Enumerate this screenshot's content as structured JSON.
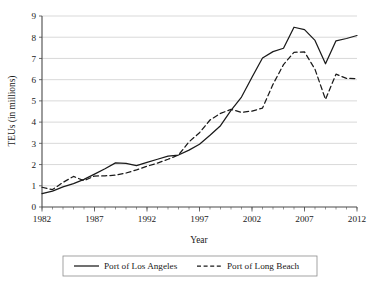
{
  "chart_data": {
    "type": "line",
    "title": "",
    "xlabel": "Year",
    "ylabel": "TEUs (in millions)",
    "xlim": [
      1982,
      2012
    ],
    "ylim": [
      0,
      9
    ],
    "grid": true,
    "legend_position": "bottom",
    "y_ticks": [
      "0",
      "1",
      "2",
      "3",
      "4",
      "5",
      "6",
      "7",
      "8",
      "9"
    ],
    "x_ticks": [
      "1982",
      "1987",
      "1992",
      "1997",
      "2002",
      "2007",
      "2012"
    ],
    "x": [
      1982,
      1983,
      1984,
      1985,
      1986,
      1987,
      1988,
      1989,
      1990,
      1991,
      1992,
      1993,
      1994,
      1995,
      1996,
      1997,
      1998,
      1999,
      2000,
      2001,
      2002,
      2003,
      2004,
      2005,
      2006,
      2007,
      2008,
      2009,
      2010,
      2011,
      2012
    ],
    "series": [
      {
        "name": "Port of Los Angeles",
        "style": "solid",
        "color": "#1a1a1a",
        "values": [
          0.63,
          0.75,
          0.95,
          1.1,
          1.3,
          1.55,
          1.8,
          2.08,
          2.06,
          1.95,
          2.1,
          2.25,
          2.4,
          2.45,
          2.68,
          2.96,
          3.38,
          3.83,
          4.55,
          5.18,
          6.11,
          7.02,
          7.32,
          7.48,
          8.47,
          8.36,
          7.85,
          6.75,
          7.83,
          7.94,
          8.08
        ]
      },
      {
        "name": "Port of Long Beach",
        "style": "dashed",
        "color": "#1a1a1a",
        "values": [
          0.93,
          0.82,
          1.16,
          1.44,
          1.24,
          1.46,
          1.47,
          1.5,
          1.6,
          1.75,
          1.92,
          2.07,
          2.25,
          2.45,
          3.07,
          3.5,
          4.1,
          4.41,
          4.6,
          4.46,
          4.52,
          4.66,
          5.78,
          6.71,
          7.29,
          7.31,
          6.49,
          5.07,
          6.26,
          6.06,
          6.05
        ]
      }
    ]
  },
  "legend": {
    "entries": [
      {
        "label": "Port of Los Angeles",
        "style": "solid"
      },
      {
        "label": "Port of Long Beach",
        "style": "dashed"
      }
    ]
  }
}
